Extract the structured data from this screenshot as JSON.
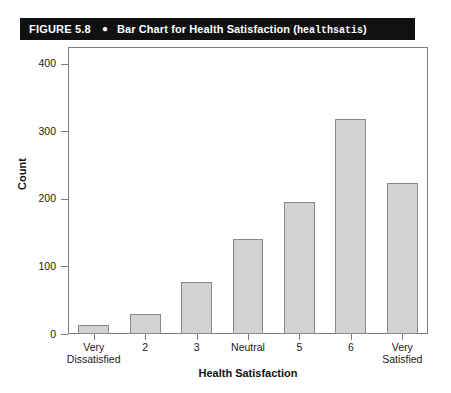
{
  "caption": {
    "figure_number": "FIGURE 5.8",
    "bullet": "●",
    "title": "Bar Chart for Health Satisfaction (",
    "variable": "healthsatis",
    "title_close": ")"
  },
  "chart_data": {
    "type": "bar",
    "title": "Bar Chart for Health Satisfaction (healthsatis)",
    "categories": [
      "Very\nDissatisfied",
      "2",
      "3",
      "Neutral",
      "5",
      "6",
      "Very Satisfied"
    ],
    "values": [
      13,
      30,
      77,
      140,
      195,
      318,
      223
    ],
    "xlabel": "Health Satisfaction",
    "ylabel": "Count",
    "ylim": [
      0,
      425
    ],
    "yticks": [
      0,
      100,
      200,
      300,
      400
    ],
    "ytick_labels": [
      "0",
      "100",
      "200",
      "300",
      "400"
    ],
    "grid": false,
    "legend": null,
    "bar_color": "#d2d2d2",
    "bar_edge_color": "#8a8a8a",
    "frame_color": "#7d7d7d"
  }
}
